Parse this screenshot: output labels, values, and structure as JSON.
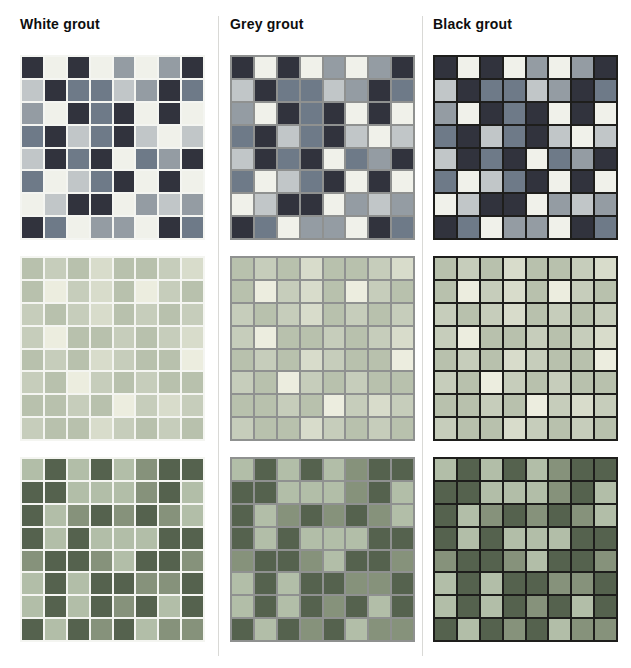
{
  "page": {
    "background": "#ffffff"
  },
  "columns": [
    {
      "id": "white-grout",
      "header": "White grout",
      "grout_color": "#f4f5f1"
    },
    {
      "id": "grey-grout",
      "header": "Grey grout",
      "grout_color": "#8f9190"
    },
    {
      "id": "black-grout",
      "header": "Black grout",
      "grout_color": "#1e1e1c"
    }
  ],
  "designs": [
    {
      "id": "blue-mosaic",
      "palette": {
        "n": "#31333d",
        "w": "#f0f1ea",
        "s": "#6e7a88",
        "g": "#949ca3",
        "l": "#c1c6c8"
      },
      "rows": [
        "nwnwgwgn",
        "lnsslgns",
        "gwnsnwnw",
        "snlsnlwl",
        "lnsnwsgn",
        "swlsnwnw",
        "wlnnwglg",
        "nswggwns"
      ]
    },
    {
      "id": "pale-green-mosaic",
      "palette": {
        "a": "#c6cdbb",
        "b": "#b8c1ad",
        "c": "#eceddf",
        "d": "#d8dccb"
      },
      "rows": [
        "babdbbad",
        "bcadbcab",
        "abadbaba",
        "acbbabad",
        "babdabbc",
        "abcababb",
        "bbabcada",
        "abbdabab"
      ]
    },
    {
      "id": "green-mosaic",
      "palette": {
        "l": "#b2bea8",
        "m": "#86927b",
        "d": "#55624e"
      },
      "rows": [
        "ldldlmdd",
        "ddlllmdl",
        "dlmdmdml",
        "dldllldd",
        "mddmlddm",
        "ldlddmmd",
        "ldldmdld",
        "dldmdlmm"
      ]
    }
  ]
}
